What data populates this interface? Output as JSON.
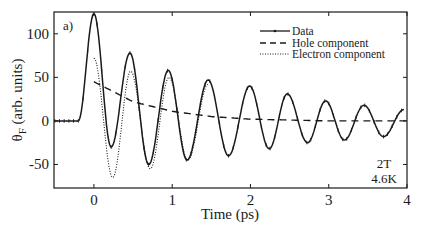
{
  "chart_data": {
    "type": "line",
    "panel_label": "a)",
    "title": "",
    "xlabel": "Time (ps)",
    "ylabel": "θF (arb. units)",
    "ylabel_main": "θ",
    "ylabel_sub": "F",
    "ylabel_rest": " (arb. units)",
    "xlim": [
      -0.51,
      4.0
    ],
    "ylim": [
      -77,
      125
    ],
    "xticks": [
      0,
      1,
      2,
      3,
      4
    ],
    "xtick_labels": [
      "0",
      "1",
      "2",
      "3",
      "4"
    ],
    "yticks": [
      -50,
      0,
      50,
      100
    ],
    "ytick_labels": [
      "-50",
      "0",
      "50",
      "100"
    ],
    "grid": false,
    "legend_position": "upper right",
    "legend": [
      {
        "name": "Data",
        "style": "solid-with-markers"
      },
      {
        "name": "Hole component",
        "style": "dashed"
      },
      {
        "name": "Electron component",
        "style": "dotted"
      }
    ],
    "annotations": [
      "2T",
      "4.6K"
    ],
    "series": [
      {
        "name": "Data",
        "style": "solid-with-markers",
        "extrema": {
          "x": [
            -0.5,
            -0.2,
            0.0,
            0.22,
            0.46,
            0.7,
            0.95,
            1.19,
            1.46,
            1.72,
            1.99,
            2.24,
            2.47,
            2.73,
            2.96,
            3.2,
            3.45,
            3.7,
            3.96
          ],
          "y": [
            0,
            0,
            123,
            -30,
            78,
            -50,
            58,
            -45,
            47,
            -40,
            40,
            -32,
            31,
            -25,
            23,
            -22,
            18,
            -18,
            13
          ]
        }
      },
      {
        "name": "Hole component",
        "style": "dashed",
        "x": [
          0.0,
          0.5,
          1.0,
          1.5,
          2.0,
          2.5,
          3.0,
          3.5,
          4.0
        ],
        "y": [
          45,
          22,
          11,
          5,
          2,
          1,
          0,
          0,
          0
        ]
      },
      {
        "name": "Electron component",
        "style": "dotted",
        "extrema": {
          "x": [
            0.0,
            0.24,
            0.47,
            0.72,
            0.96,
            1.2,
            1.46
          ],
          "y": [
            72,
            -65,
            57,
            -55,
            50,
            -45,
            42
          ]
        }
      }
    ]
  }
}
